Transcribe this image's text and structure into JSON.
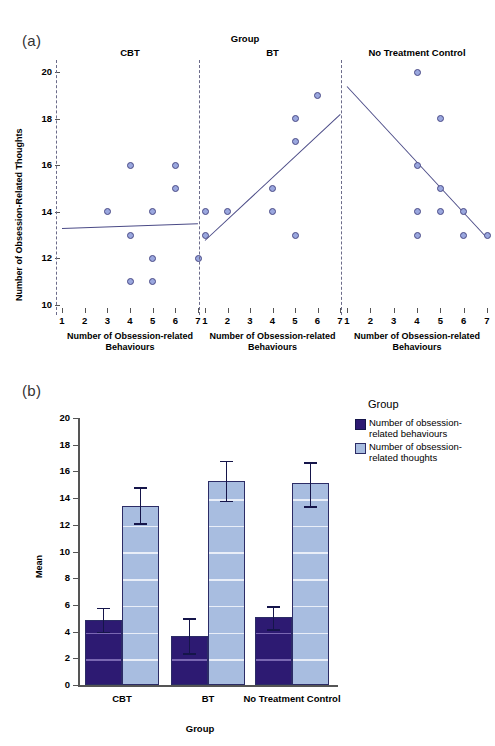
{
  "figure": {
    "panel_a_label": "(a)",
    "panel_b_label": "(b)"
  },
  "chart_data": [
    {
      "type": "scatter",
      "panel": "a",
      "title": "Group",
      "xlabel": "Number of Obsession-related Behaviours",
      "ylabel": "Number of Obsession-Related Thoughts",
      "ylim": [
        10,
        20
      ],
      "yticks": [
        10,
        12,
        14,
        16,
        18,
        20
      ],
      "xlim": [
        1,
        7
      ],
      "xticks": [
        1,
        2,
        3,
        4,
        5,
        6,
        7
      ],
      "grid": false,
      "marker_fill": "#9aa7de",
      "marker_edge": "#4a4a86",
      "line_color": "#4a4a86",
      "facets": [
        {
          "name": "CBT",
          "points": [
            {
              "x": 3,
              "y": 14
            },
            {
              "x": 4,
              "y": 16
            },
            {
              "x": 4,
              "y": 13
            },
            {
              "x": 4,
              "y": 11
            },
            {
              "x": 5,
              "y": 14
            },
            {
              "x": 5,
              "y": 12
            },
            {
              "x": 5,
              "y": 11
            },
            {
              "x": 6,
              "y": 16
            },
            {
              "x": 6,
              "y": 15
            },
            {
              "x": 7,
              "y": 12
            }
          ],
          "fit_line": {
            "x1": 1,
            "y1": 13.3,
            "x2": 7,
            "y2": 13.5
          }
        },
        {
          "name": "BT",
          "points": [
            {
              "x": 1,
              "y": 13
            },
            {
              "x": 1,
              "y": 14
            },
            {
              "x": 2,
              "y": 14
            },
            {
              "x": 4,
              "y": 15
            },
            {
              "x": 4,
              "y": 14
            },
            {
              "x": 5,
              "y": 18
            },
            {
              "x": 5,
              "y": 17
            },
            {
              "x": 5,
              "y": 13
            },
            {
              "x": 6,
              "y": 19
            }
          ],
          "fit_line": {
            "x1": 1,
            "y1": 12.8,
            "x2": 7,
            "y2": 18.2
          }
        },
        {
          "name": "No Treatment Control",
          "points": [
            {
              "x": 4,
              "y": 20
            },
            {
              "x": 4,
              "y": 16
            },
            {
              "x": 4,
              "y": 14
            },
            {
              "x": 4,
              "y": 13
            },
            {
              "x": 5,
              "y": 18
            },
            {
              "x": 5,
              "y": 15
            },
            {
              "x": 5,
              "y": 14
            },
            {
              "x": 6,
              "y": 14
            },
            {
              "x": 6,
              "y": 13
            },
            {
              "x": 7,
              "y": 13
            }
          ],
          "fit_line": {
            "x1": 1,
            "y1": 19.4,
            "x2": 7,
            "y2": 12.9
          }
        }
      ]
    },
    {
      "type": "bar",
      "panel": "b",
      "title": "Group",
      "xlabel": "Group",
      "ylabel": "Mean",
      "ylim": [
        0,
        20
      ],
      "yticks": [
        0,
        2,
        4,
        6,
        8,
        10,
        12,
        14,
        16,
        18,
        20
      ],
      "categories": [
        "CBT",
        "BT",
        "No Treatment Control"
      ],
      "legend_title": "Group",
      "legend_position": "right",
      "series": [
        {
          "name": "Number of obsession-related behaviours",
          "color": "#2d1a72",
          "values": [
            4.9,
            3.7,
            5.1
          ],
          "err_low": [
            4.0,
            2.4,
            4.2
          ],
          "err_high": [
            5.8,
            5.0,
            5.9
          ]
        },
        {
          "name": "Number of obsession-related thoughts",
          "color": "#a8bde0",
          "values": [
            13.4,
            15.3,
            15.1
          ],
          "err_low": [
            12.1,
            13.8,
            13.4
          ],
          "err_high": [
            14.8,
            16.8,
            16.7
          ]
        }
      ]
    }
  ]
}
